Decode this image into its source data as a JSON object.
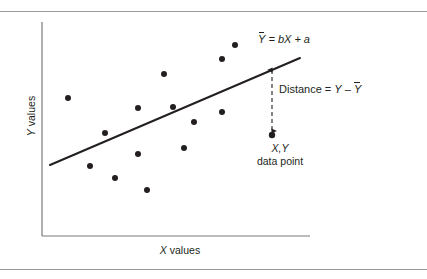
{
  "figure": {
    "kind": "regression-scatter-diagram",
    "background": "#ffffff",
    "ink_color": "#231f20",
    "rule_color": "#9a9a9a"
  },
  "axes": {
    "y_label_italic": "Y",
    "y_label_rest": " values",
    "x_label_italic": "X",
    "x_label_rest": " values",
    "y_axis": {
      "x": 42,
      "y_top": 22,
      "y_bottom": 236
    },
    "x_axis": {
      "y": 236,
      "x_left": 42,
      "x_right": 310
    }
  },
  "annotations": {
    "equation": {
      "y_hat": "Y",
      "body": " = bX + a"
    },
    "distance": {
      "prefix": "Distance = ",
      "y_plain": "Y",
      "minus": " – ",
      "y_hat": "Y"
    },
    "datapoint": {
      "line1": "X,Y",
      "line2": "data point"
    }
  },
  "chart_data": {
    "type": "scatter",
    "title": "",
    "xlabel": "X values",
    "ylabel": "Y values",
    "grid": false,
    "legend": null,
    "axis_ticks": {
      "x": [],
      "y": []
    },
    "note": "Pixel coordinates within the 427x279 figure; y grows downward.",
    "points": [
      {
        "x": 68,
        "y": 98,
        "r": 3.0
      },
      {
        "x": 105,
        "y": 133,
        "r": 3.0
      },
      {
        "x": 90,
        "y": 166,
        "r": 3.0
      },
      {
        "x": 115,
        "y": 178,
        "r": 3.0
      },
      {
        "x": 147,
        "y": 190,
        "r": 3.0
      },
      {
        "x": 138,
        "y": 154,
        "r": 3.0
      },
      {
        "x": 138,
        "y": 108,
        "r": 3.0
      },
      {
        "x": 164,
        "y": 74,
        "r": 3.0
      },
      {
        "x": 173,
        "y": 107,
        "r": 3.0
      },
      {
        "x": 184,
        "y": 148,
        "r": 3.0
      },
      {
        "x": 194,
        "y": 122,
        "r": 3.0
      },
      {
        "x": 222,
        "y": 59,
        "r": 3.0
      },
      {
        "x": 222,
        "y": 112,
        "r": 3.0
      },
      {
        "x": 235,
        "y": 45,
        "r": 3.0
      },
      {
        "x": 272,
        "y": 135,
        "r": 3.2
      }
    ],
    "highlighted_point": {
      "x": 272,
      "y": 135,
      "label": "X,Y data point"
    },
    "regression_line": {
      "label": "Y = bX + a",
      "x1": 50,
      "y1": 165,
      "x2": 300,
      "y2": 58,
      "width": 2.0
    },
    "residual_arrow": {
      "label": "Distance = Y – Y",
      "x": 272,
      "y_top": 70,
      "y_bottom": 131,
      "style": "dashed-double-headed"
    }
  }
}
